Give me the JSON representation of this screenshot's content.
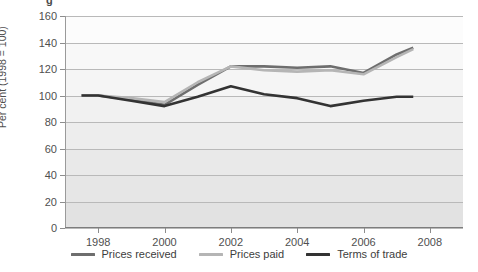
{
  "figure": {
    "top_fragment": "g"
  },
  "legend": {
    "position": "bottom-center",
    "items": [
      {
        "label": "Prices received",
        "color": "#6e6e6e",
        "swatch_name": "legend-swatch-prices-received"
      },
      {
        "label": "Prices paid",
        "color": "#b5b5b5",
        "swatch_name": "legend-swatch-prices-paid"
      },
      {
        "label": "Terms of trade",
        "color": "#333333",
        "swatch_name": "legend-swatch-terms-of-trade"
      }
    ]
  },
  "chart_data": {
    "type": "line",
    "title": "",
    "subtitle": "",
    "xlabel": "",
    "ylabel": "Per cent (1998 = 100)",
    "xlim": [
      1997,
      2009
    ],
    "ylim": [
      0,
      160
    ],
    "yticks": [
      0,
      20,
      40,
      60,
      80,
      100,
      120,
      140,
      160
    ],
    "xticks": [
      1998,
      2000,
      2002,
      2004,
      2006,
      2008
    ],
    "grid": "horizontal",
    "background_bands": true,
    "x": [
      1997.5,
      1998,
      1999,
      2000,
      2001,
      2002,
      2003,
      2004,
      2005,
      2006,
      2007,
      2007.5
    ],
    "series": [
      {
        "name": "Prices received",
        "color": "#6e6e6e",
        "values": [
          100,
          100,
          97,
          93,
          108,
          122,
          122,
          121,
          122,
          117,
          131,
          136
        ]
      },
      {
        "name": "Prices paid",
        "color": "#b5b5b5",
        "values": [
          100,
          100,
          98,
          95,
          110,
          122,
          119,
          118,
          119,
          116,
          129,
          135
        ]
      },
      {
        "name": "Terms of trade",
        "color": "#333333",
        "values": [
          100,
          100,
          96,
          92,
          99,
          107,
          101,
          98,
          92,
          96,
          99,
          99
        ]
      }
    ]
  }
}
